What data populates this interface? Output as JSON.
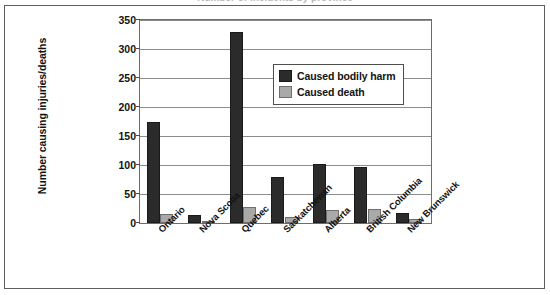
{
  "figure": {
    "cropped_title_remnant": "Number of incidents by province",
    "frame": "scanned-page-border"
  },
  "chart_data": {
    "type": "bar",
    "title": "",
    "xlabel": "",
    "ylabel": "Number causing injuries/deaths",
    "ylim": [
      0,
      350
    ],
    "ytick_step": 50,
    "yticks": [
      "0",
      "50",
      "100",
      "150",
      "200",
      "250",
      "300",
      "350"
    ],
    "grid": "horizontal",
    "legend_position": "upper-center-right",
    "categories": [
      "Ontario",
      "Nova Scotia",
      "Quebec",
      "Saskatchewan",
      "Alberta",
      "British Columbia",
      "New Brunswick"
    ],
    "series": [
      {
        "name": "Caused bodily harm",
        "color": "#2b2b2b",
        "values": [
          174,
          13,
          330,
          79,
          102,
          97,
          18
        ]
      },
      {
        "name": "Caused death",
        "color": "#a9a9a9",
        "values": [
          16,
          3,
          28,
          10,
          23,
          24,
          7
        ]
      }
    ]
  }
}
